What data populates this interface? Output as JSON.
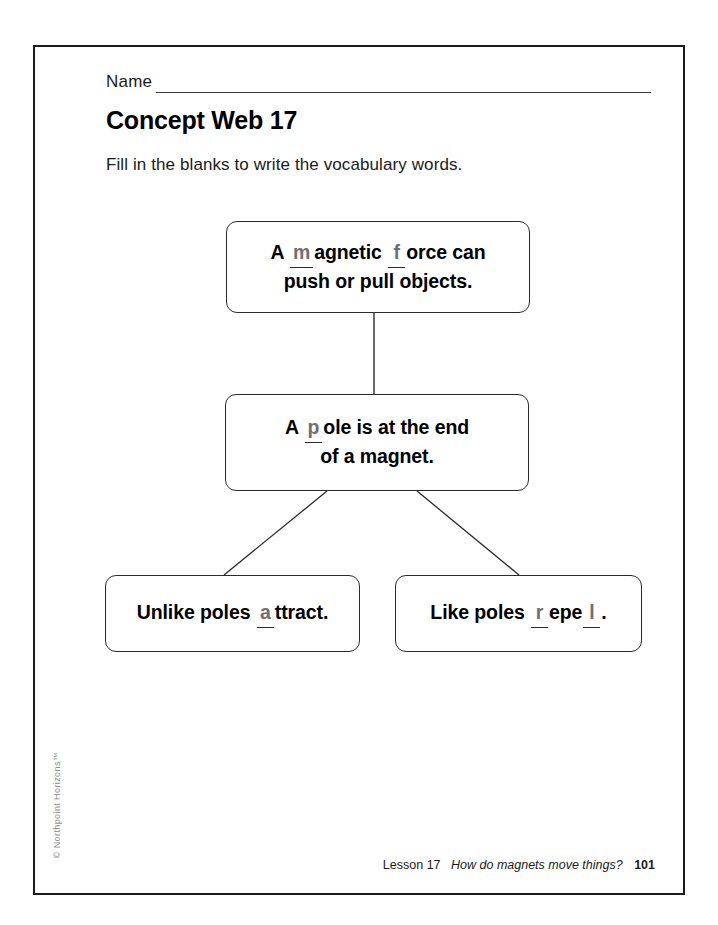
{
  "page": {
    "name_label": "Name",
    "title": "Concept Web 17",
    "instructions": "Fill in the blanks to write the vocabulary words.",
    "copyright": "© Northpoint Horizons™"
  },
  "concept_web": {
    "boxes": [
      {
        "id": "magnetic-force",
        "full_text": "A m agnetic f orce can push or pull objects.",
        "segments": {
          "pre": "A",
          "blank1": "m",
          "mid1": "agnetic",
          "blank2": "f",
          "mid2": "orce can",
          "line2": "push or pull objects."
        }
      },
      {
        "id": "pole",
        "full_text": "A p ole is at the end of a magnet.",
        "segments": {
          "pre": "A",
          "blank1": "p",
          "mid1": "ole is at the end",
          "line2": "of a magnet."
        }
      },
      {
        "id": "unlike-poles",
        "full_text": "Unlike poles a ttract.",
        "segments": {
          "pre": "Unlike poles",
          "blank1": "a",
          "mid1": "ttract."
        }
      },
      {
        "id": "like-poles",
        "full_text": "Like poles r epe l .",
        "segments": {
          "pre": "Like poles",
          "blank1": "r",
          "mid1": "epe",
          "blank2": "l",
          "mid2": "."
        }
      }
    ]
  },
  "footer": {
    "lesson": "Lesson 17",
    "question": "How do magnets move things?",
    "page_number": "101"
  },
  "colors": {
    "ink": "#000000",
    "rule": "#2b2b2b",
    "answer_fill": "#6f6f6f",
    "copyright_grey": "#8d8d8d",
    "page_background": "#ffffff"
  }
}
